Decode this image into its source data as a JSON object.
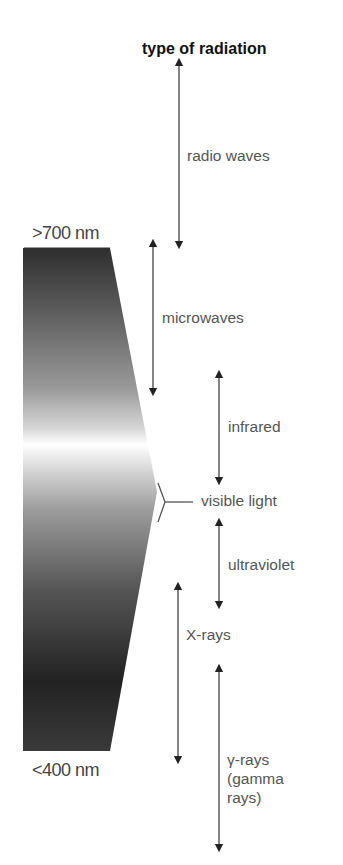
{
  "title": "type of radiation",
  "scale": {
    "top_label": ">700 nm",
    "bottom_label": "<400 nm"
  },
  "bands": [
    {
      "name": "radio waves"
    },
    {
      "name": "microwaves"
    },
    {
      "name": "infrared"
    },
    {
      "name": "visible light"
    },
    {
      "name": "ultraviolet"
    },
    {
      "name": "X-rays"
    },
    {
      "name": "gamma_rays",
      "line1": "γ-rays",
      "line2": "(gamma",
      "line3": "rays)"
    }
  ],
  "colors": {
    "arrow": "#222222",
    "gradient_dark": "#2e2e2e",
    "gradient_light": "#ffffff",
    "bracket": "#555555"
  }
}
